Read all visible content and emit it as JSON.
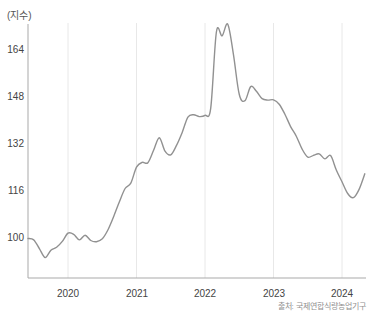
{
  "chart_data": {
    "type": "line",
    "title": "",
    "unit_label": "(지수)",
    "source": "출처: 국제연합식량농업기구",
    "legend": [],
    "grid": "vertical-year-gridlines",
    "xticks": [
      "2020",
      "2021",
      "2022",
      "2023",
      "2024"
    ],
    "yticks": [
      "164",
      "148",
      "132",
      "116",
      "100"
    ],
    "ylim": [
      88,
      176
    ],
    "x_range": [
      "2019-06",
      "2024-05"
    ],
    "frequency": "monthly",
    "line_color": "#919191",
    "x_dates": [
      "2019-06",
      "2019-07",
      "2019-08",
      "2019-09",
      "2019-10",
      "2019-11",
      "2019-12",
      "2020-01",
      "2020-02",
      "2020-03",
      "2020-04",
      "2020-05",
      "2020-06",
      "2020-07",
      "2020-08",
      "2020-09",
      "2020-10",
      "2020-11",
      "2020-12",
      "2021-01",
      "2021-02",
      "2021-03",
      "2021-04",
      "2021-05",
      "2021-06",
      "2021-07",
      "2021-08",
      "2021-09",
      "2021-10",
      "2021-11",
      "2021-12",
      "2022-01",
      "2022-02",
      "2022-03",
      "2022-04",
      "2022-05",
      "2022-06",
      "2022-07",
      "2022-08",
      "2022-09",
      "2022-10",
      "2022-11",
      "2022-12",
      "2023-01",
      "2023-02",
      "2023-03",
      "2023-04",
      "2023-05",
      "2023-06",
      "2023-07",
      "2023-08",
      "2023-09",
      "2023-10",
      "2023-11",
      "2023-12",
      "2024-01",
      "2024-02",
      "2024-03",
      "2024-04",
      "2024-05"
    ],
    "values": [
      99.5,
      99.0,
      96.0,
      93.0,
      95.5,
      96.5,
      98.5,
      101.3,
      100.9,
      99.0,
      100.6,
      98.8,
      98.4,
      99.4,
      102.5,
      107.0,
      112.0,
      116.5,
      118.3,
      123.8,
      125.4,
      125.3,
      129.5,
      133.8,
      129.2,
      128.0,
      131.2,
      135.6,
      140.8,
      141.6,
      141.0,
      141.4,
      143.8,
      169.8,
      168.5,
      172.4,
      162.0,
      148.5,
      146.4,
      151.2,
      149.6,
      147.1,
      146.6,
      146.7,
      145.2,
      141.8,
      137.6,
      134.3,
      130.0,
      127.2,
      127.8,
      128.3,
      126.6,
      127.7,
      122.8,
      118.8,
      114.8,
      113.4,
      116.2,
      121.5
    ]
  }
}
